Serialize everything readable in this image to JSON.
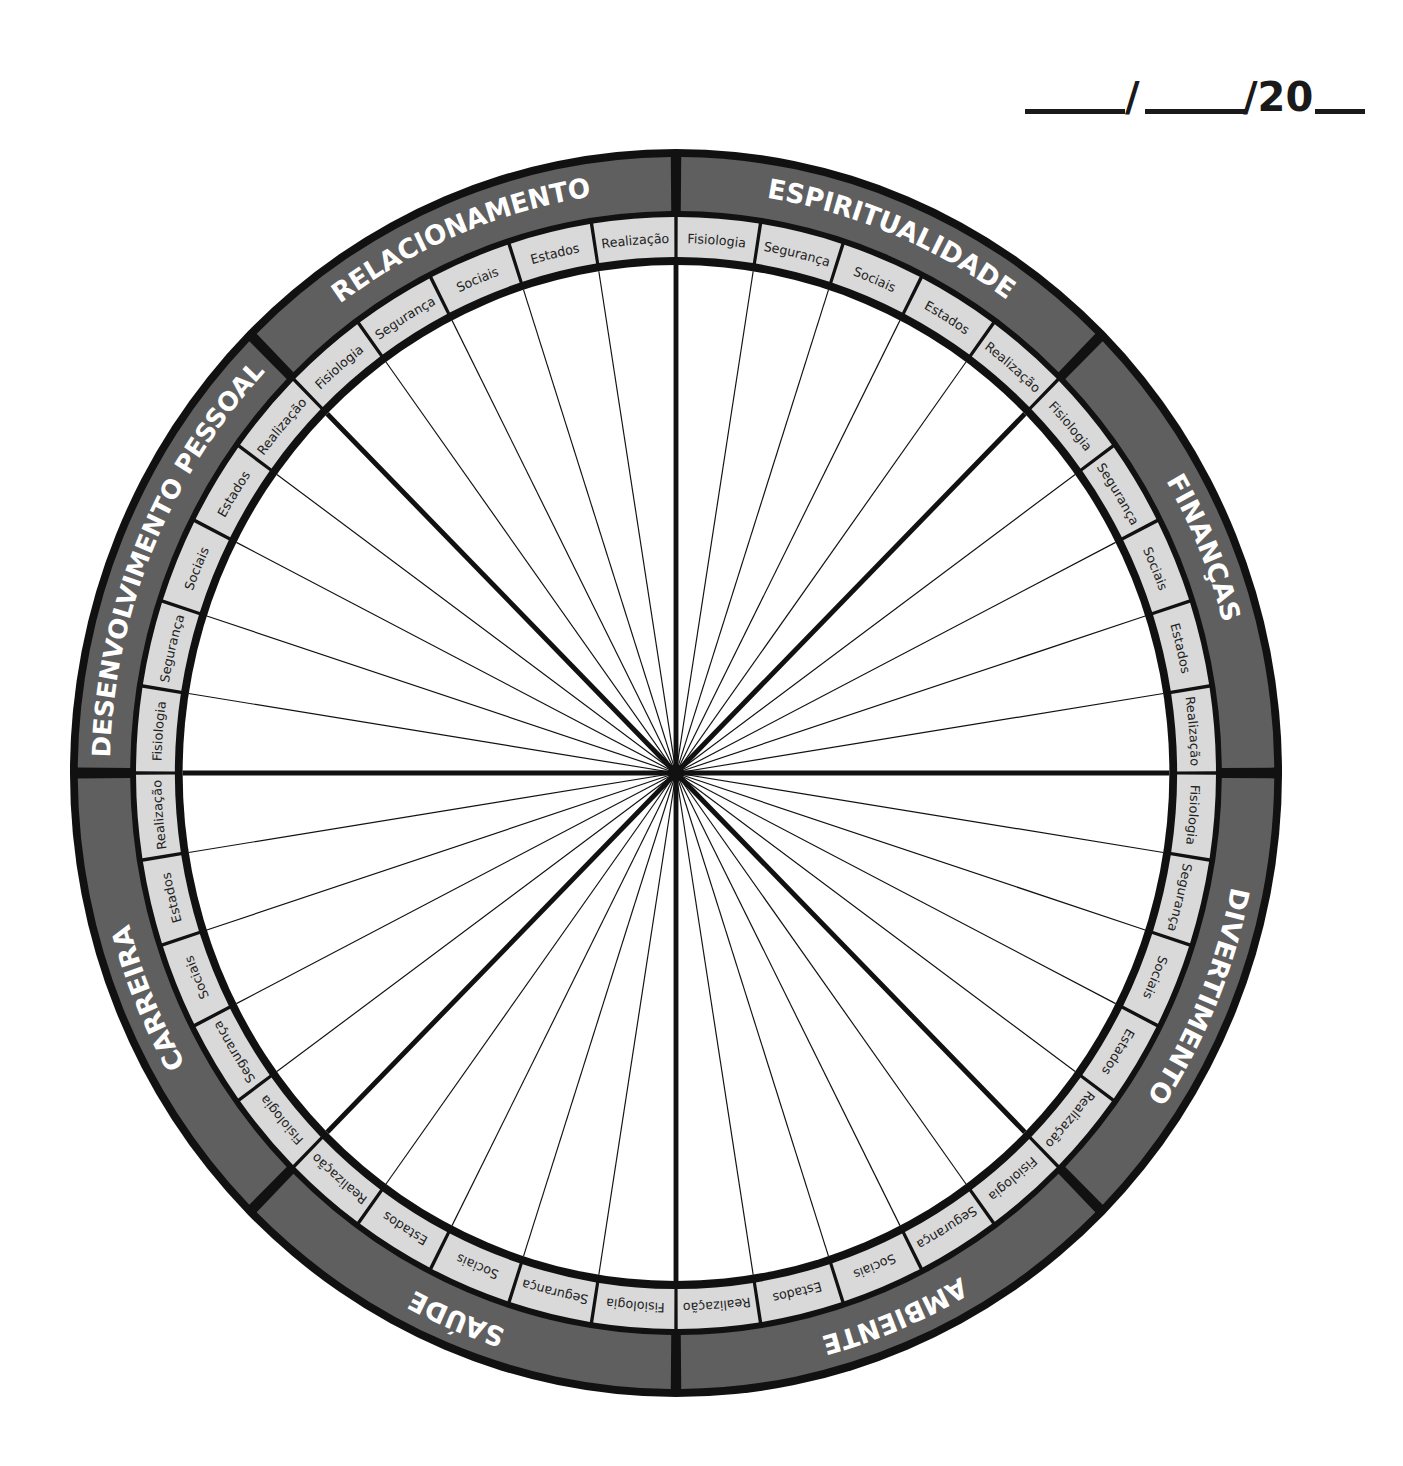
{
  "date_field": {
    "separator1": "/",
    "separator2": "/20",
    "blanks": 3
  },
  "wheel": {
    "center": [
      676,
      773
    ],
    "categories": [
      {
        "name": "ESPIRITUALIDADE",
        "subitems": [
          "Fisiologia",
          "Segurança",
          "Sociais",
          "Estados",
          "Realização"
        ]
      },
      {
        "name": "FINANÇAS",
        "subitems": [
          "Fisiologia",
          "Segurança",
          "Sociais",
          "Estados",
          "Realização"
        ]
      },
      {
        "name": "DIVERTIMENTO",
        "subitems": [
          "Fisiologia",
          "Segurança",
          "Sociais",
          "Estados",
          "Realização"
        ]
      },
      {
        "name": "AMBIENTE",
        "subitems": [
          "Fisiologia",
          "Segurança",
          "Sociais",
          "Estados",
          "Realização"
        ]
      },
      {
        "name": "SAÚDE",
        "subitems": [
          "Fisiologia",
          "Segurança",
          "Sociais",
          "Estados",
          "Realização"
        ]
      },
      {
        "name": "CARREIRA",
        "subitems": [
          "Fisiologia",
          "Segurança",
          "Sociais",
          "Estados",
          "Realização"
        ]
      },
      {
        "name": "DESENVOLVIMENTO PESSOAL",
        "subitems": [
          "Fisiologia",
          "Segurança",
          "Sociais",
          "Estados",
          "Realização"
        ]
      },
      {
        "name": "RELACIONAMENTO",
        "subitems": [
          "Fisiologia",
          "Segurança",
          "Sociais",
          "Estados",
          "Realização"
        ]
      }
    ],
    "colors": {
      "outline": "#111111",
      "category_band": "#5f5f5f",
      "subitem_band": "#d9d9d9",
      "category_text": "#ffffff",
      "subitem_text": "#222222"
    }
  }
}
